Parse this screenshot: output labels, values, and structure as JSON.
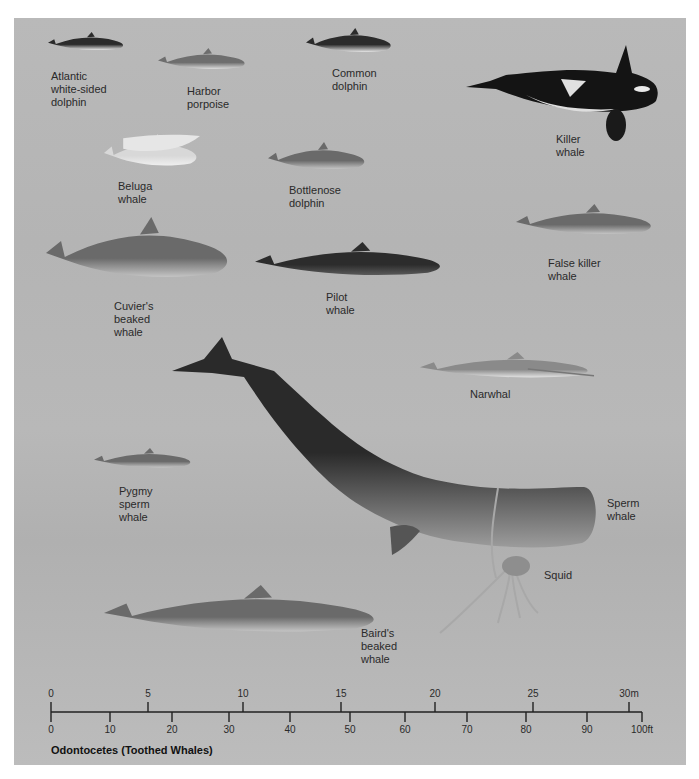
{
  "figure": {
    "title": "Odontocetes (Toothed Whales)",
    "background_color": "#b7b7b7",
    "panel": {
      "left": 14,
      "top": 18,
      "width": 672,
      "height": 747
    }
  },
  "species": [
    {
      "id": "atlantic-white-sided-dolphin",
      "label": "Atlantic\nwhite-sided\ndolphin",
      "label_pos": [
        51,
        70
      ],
      "shape": [
        48,
        32,
        78,
        24
      ],
      "tone": "dark-white"
    },
    {
      "id": "harbor-porpoise",
      "label": "Harbor\nporpoise",
      "label_pos": [
        187,
        85
      ],
      "shape": [
        158,
        48,
        90,
        28
      ],
      "tone": "grey-white"
    },
    {
      "id": "common-dolphin",
      "label": "Common\ndolphin",
      "label_pos": [
        332,
        67
      ],
      "shape": [
        306,
        28,
        88,
        32
      ],
      "tone": "dark-white"
    },
    {
      "id": "killer-whale",
      "label": "Killer\nwhale",
      "label_pos": [
        556,
        133
      ],
      "shape": [
        466,
        45,
        192,
        98
      ],
      "tone": "orca"
    },
    {
      "id": "beluga-whale",
      "label": "Beluga\nwhale",
      "label_pos": [
        118,
        180
      ],
      "shape": [
        104,
        134,
        96,
        42
      ],
      "tone": "white"
    },
    {
      "id": "bottlenose-dolphin",
      "label": "Bottlenose\ndolphin",
      "label_pos": [
        289,
        184
      ],
      "shape": [
        268,
        142,
        100,
        36
      ],
      "tone": "grey"
    },
    {
      "id": "false-killer-whale",
      "label": "False killer\nwhale",
      "label_pos": [
        548,
        257
      ],
      "shape": [
        516,
        204,
        140,
        40
      ],
      "tone": "grey"
    },
    {
      "id": "cuviers-beaked-whale",
      "label": "Cuvier's\nbeaked\nwhale",
      "label_pos": [
        114,
        300
      ],
      "shape": [
        46,
        217,
        188,
        80
      ],
      "tone": "grey"
    },
    {
      "id": "pilot-whale",
      "label": "Pilot\nwhale",
      "label_pos": [
        326,
        291
      ],
      "shape": [
        255,
        242,
        192,
        44
      ],
      "tone": "dark"
    },
    {
      "id": "narwhal",
      "label": "Narwhal",
      "label_pos": [
        470,
        388
      ],
      "shape": [
        420,
        352,
        174,
        34
      ],
      "tone": "speckled"
    },
    {
      "id": "pygmy-sperm-whale",
      "label": "Pygmy\nsperm\nwhale",
      "label_pos": [
        119,
        485
      ],
      "shape": [
        94,
        448,
        100,
        26
      ],
      "tone": "grey"
    },
    {
      "id": "sperm-whale",
      "label": "Sperm\nwhale",
      "label_pos": [
        607,
        497
      ],
      "shape": [
        164,
        337,
        432,
        222
      ],
      "tone": "sperm"
    },
    {
      "id": "squid",
      "label": "Squid",
      "label_pos": [
        544,
        569
      ],
      "shape": [
        438,
        488,
        102,
        145
      ],
      "tone": "squid"
    },
    {
      "id": "bairds-beaked-whale",
      "label": "Baird's\nbeaked\nwhale",
      "label_pos": [
        361,
        627
      ],
      "shape": [
        104,
        585,
        280,
        62
      ],
      "tone": "grey"
    }
  ],
  "scale_bar": {
    "x_start": 51,
    "x_end": 642,
    "y_line": 712,
    "metric": {
      "unit": "m",
      "ticks": [
        {
          "value": 0,
          "label": "0",
          "x": 51
        },
        {
          "value": 5,
          "label": "5",
          "x": 148
        },
        {
          "value": 10,
          "label": "10",
          "x": 243
        },
        {
          "value": 15,
          "label": "15",
          "x": 341
        },
        {
          "value": 20,
          "label": "20",
          "x": 435
        },
        {
          "value": 25,
          "label": "25",
          "x": 533
        },
        {
          "value": 30,
          "label": "30m",
          "x": 629
        }
      ]
    },
    "imperial": {
      "unit": "ft",
      "ticks": [
        {
          "value": 0,
          "label": "0",
          "x": 51
        },
        {
          "value": 10,
          "label": "10",
          "x": 110
        },
        {
          "value": 20,
          "label": "20",
          "x": 172
        },
        {
          "value": 30,
          "label": "30",
          "x": 229
        },
        {
          "value": 40,
          "label": "40",
          "x": 290
        },
        {
          "value": 50,
          "label": "50",
          "x": 350
        },
        {
          "value": 60,
          "label": "60",
          "x": 405
        },
        {
          "value": 70,
          "label": "70",
          "x": 467
        },
        {
          "value": 80,
          "label": "80",
          "x": 526
        },
        {
          "value": 90,
          "label": "90",
          "x": 587
        },
        {
          "value": 100,
          "label": "100ft",
          "x": 642
        }
      ]
    }
  }
}
